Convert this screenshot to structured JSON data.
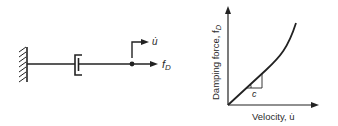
{
  "colors": {
    "ink": "#222222",
    "background": "#ffffff"
  },
  "left_diagram": {
    "velocity_label": "u̇",
    "force_label_main": "f",
    "force_label_sub": "D"
  },
  "right_chart": {
    "y_axis_label_main": "Damping force, f",
    "y_axis_label_sub": "D",
    "x_axis_label": "Velocity, u̇",
    "slope_label": "c"
  }
}
